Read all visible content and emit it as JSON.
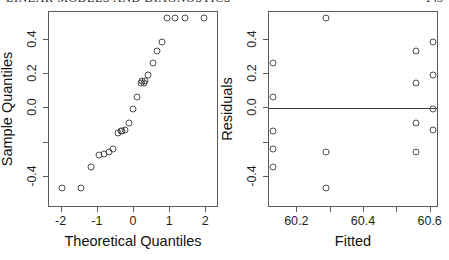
{
  "page": {
    "running_head": "LINEAR MODELS AND DIAGNOSTICS",
    "page_number": "143",
    "background": "#ffffff",
    "point_color": "#4d4d4d",
    "axis_color": "#5a5a5a"
  },
  "chart_data": [
    {
      "type": "scatter",
      "title": "",
      "panel": "left",
      "xlabel": "Theoretical Quantiles",
      "ylabel": "Sample Quantiles",
      "xlim": [
        -2.35,
        2.35
      ],
      "ylim": [
        -0.58,
        0.56
      ],
      "grid": false,
      "legend": false,
      "xticks": [
        -2,
        -1,
        0,
        1,
        2
      ],
      "xticklabels": [
        "-2",
        "-1",
        "0",
        "1",
        "2"
      ],
      "yticks": [
        0.4,
        0.2,
        0.0,
        -0.2,
        -0.4
      ],
      "yticklabels": [
        "0.4",
        "0.2",
        "0.0",
        "",
        "-0.4"
      ],
      "x": [
        -1.96,
        -1.44,
        -1.15,
        -0.93,
        -0.81,
        -0.67,
        -0.54,
        -0.42,
        -0.34,
        -0.31,
        -0.21,
        -0.1,
        0.0,
        0.1,
        0.21,
        0.24,
        0.31,
        0.34,
        0.42,
        0.54,
        0.67,
        0.81,
        0.93,
        1.15,
        1.44,
        1.96
      ],
      "y": [
        -0.47,
        -0.47,
        -0.35,
        -0.28,
        -0.27,
        -0.26,
        -0.24,
        -0.15,
        -0.14,
        -0.14,
        -0.13,
        -0.09,
        -0.01,
        0.06,
        0.14,
        0.15,
        0.14,
        0.15,
        0.19,
        0.26,
        0.33,
        0.38,
        0.52,
        0.52,
        0.52,
        0.52
      ]
    },
    {
      "type": "scatter",
      "title": "",
      "panel": "right",
      "xlabel": "Fitted",
      "ylabel": "Residuals",
      "xlim": [
        60.115,
        60.625
      ],
      "ylim": [
        -0.58,
        0.56
      ],
      "grid": false,
      "legend": false,
      "reference_line_y": 0.0,
      "xticks": [
        60.2,
        60.3,
        60.4,
        60.5,
        60.6
      ],
      "xticklabels": [
        "60.2",
        "",
        "60.4",
        "",
        "60.6"
      ],
      "yticks": [
        0.4,
        0.2,
        0.0,
        -0.2,
        -0.4
      ],
      "yticklabels": [
        "0.4",
        "0.2",
        "0.0",
        "",
        "-0.4"
      ],
      "x": [
        60.13,
        60.13,
        60.13,
        60.13,
        60.13,
        60.29,
        60.29,
        60.29,
        60.56,
        60.56,
        60.56,
        60.56,
        60.61,
        60.61,
        60.61,
        60.61
      ],
      "y": [
        0.26,
        0.06,
        -0.14,
        -0.24,
        -0.35,
        0.52,
        -0.26,
        -0.47,
        0.33,
        0.14,
        -0.09,
        -0.26,
        0.38,
        0.19,
        -0.01,
        -0.13
      ]
    }
  ]
}
